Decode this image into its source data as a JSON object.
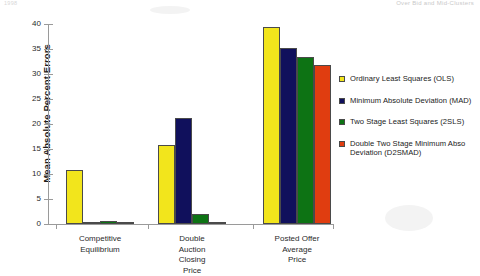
{
  "header": {
    "left_text": "1998",
    "right_text": "Over Bid and Mid-Clusters"
  },
  "chart_data": {
    "type": "bar",
    "title": "",
    "xlabel": "",
    "ylabel": "Mean Absolute Percent Errors",
    "ylim": [
      0,
      40
    ],
    "yticks": [
      0,
      5,
      10,
      15,
      20,
      25,
      30,
      35,
      40
    ],
    "ytick_labels": [
      "0",
      "5",
      "10",
      "15",
      "20",
      "25",
      "30",
      "35",
      "40"
    ],
    "grid": false,
    "legend_position": "right",
    "categories": [
      "Competitive Equilibrium",
      "Double Auction Closing Price",
      "Posted Offer Average Price"
    ],
    "category_lines": [
      [
        "Competitive",
        "Equilibrium"
      ],
      [
        "Double",
        "Auction",
        "Closing",
        "Price"
      ],
      [
        "Posted Offer",
        "Average",
        "Price"
      ]
    ],
    "series": [
      {
        "name": "Ordinary Least Squares (OLS)",
        "short": "OLS",
        "color": "#f2e51c",
        "values": [
          10.8,
          15.8,
          39.4
        ]
      },
      {
        "name": "Minimum Absolute Deviation (MAD)",
        "short": "MAD",
        "color": "#10105c",
        "values": [
          0.3,
          21.3,
          35.2
        ]
      },
      {
        "name": "Two Stage Least Squares (2SLS)",
        "short": "2SLS",
        "color": "#0d7314",
        "values": [
          0.6,
          2.1,
          33.5
        ]
      },
      {
        "name": "Double Two Stage Minimum Abso Deviation (D2SMAD)",
        "short": "D2SMAD",
        "color": "#e03d10",
        "values": [
          0.3,
          0.3,
          31.8
        ]
      }
    ]
  },
  "legend": {
    "entries": [
      {
        "label_line1": "Ordinary Least Squares (OLS)",
        "label_line2": ""
      },
      {
        "label_line1": "Minimum Absolute Deviation (MAD)",
        "label_line2": ""
      },
      {
        "label_line1": "Two Stage Least Squares (2SLS)",
        "label_line2": ""
      },
      {
        "label_line1": "Double Two Stage Minimum Abso",
        "label_line2": "Deviation (D2SMAD)"
      }
    ]
  }
}
